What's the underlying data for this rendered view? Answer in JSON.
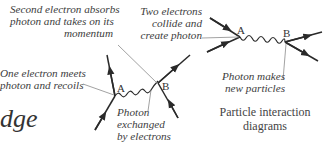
{
  "diagram": {
    "caption": [
      "Particle interaction",
      "diagrams"
    ],
    "page_fragment": "dge",
    "left_diagram": {
      "vertices": [
        "A",
        "B"
      ],
      "labels": {
        "second_electron": [
          "Second electron absorbs",
          "photon and takes on its",
          "momentum"
        ],
        "one_electron": [
          "One electron meets",
          "photon and recoils"
        ],
        "photon_exchanged": [
          "Photon",
          "exchanged",
          "by electrons"
        ]
      }
    },
    "right_diagram": {
      "vertices": [
        "A",
        "B"
      ],
      "labels": {
        "two_electrons": [
          "Two electrons",
          "collide and",
          "create photon"
        ],
        "photon_makes": [
          "Photon makes",
          "new particles"
        ]
      }
    },
    "colors": {
      "line": "#2a2a2a",
      "leader": "#8a8a8a",
      "text": "#3d3d3d"
    }
  }
}
